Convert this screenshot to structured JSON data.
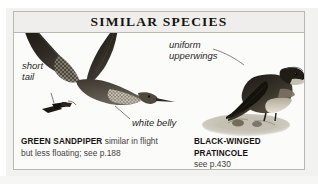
{
  "box": {
    "header": {
      "title": "SIMILAR SPECIES"
    },
    "annotations": [
      {
        "id": "short-tail",
        "text_line1": "short",
        "text_line2": "tail"
      },
      {
        "id": "white-belly",
        "text_line1": "white belly",
        "text_line2": ""
      },
      {
        "id": "uniform-upperwings",
        "text_line1": "uniform",
        "text_line2": "upperwings"
      }
    ],
    "illustrations": [
      {
        "id": "green-sandpiper",
        "subject": "green-sandpiper-in-flight",
        "description": "Green Sandpiper in flight with dark raised wings, short dark tail and white belly"
      },
      {
        "id": "black-winged-pratincole",
        "subject": "black-winged-pratincole-perched",
        "description": "Black-winged Pratincole perched on a stony mound, dark uniform upperwings"
      }
    ],
    "captions": [
      {
        "id": "green-sandpiper",
        "species": "GREEN SANDPIPER",
        "note": " similar in flight",
        "line2": "but less floating; see p.188"
      },
      {
        "id": "black-winged-pratincole",
        "species": "BLACK-WINGED PRATINCOLE",
        "note": "",
        "line2": "see p.430"
      }
    ]
  },
  "colors": {
    "frame_border": "#b9b7b2",
    "header_fill": "#efeeec",
    "box_fill": "#fbfbfa",
    "page_fill": "#f2f2f0",
    "ink_dark": "#15130f",
    "ink_body": "#46413a",
    "bird_dark": "#2b2722",
    "bird_mid": "#5d574e",
    "bird_pale": "#d8d3c9"
  }
}
